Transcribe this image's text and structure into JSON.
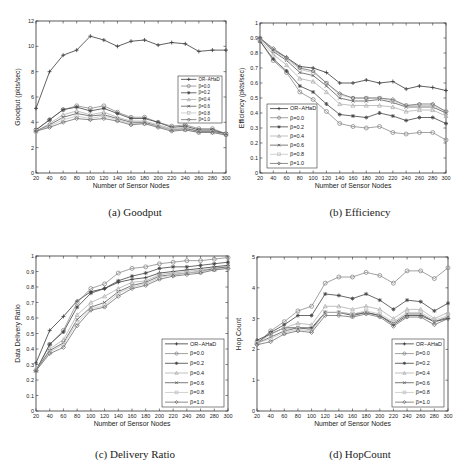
{
  "figure": {
    "captions": [
      "(a) Goodput",
      "(b) Efficiency",
      "(c) Delivery Ratio",
      "(d) HopCount"
    ]
  },
  "legend_labels": [
    "OR−AHaD",
    "β=0.0",
    "β=0.2",
    "β=0.4",
    "β=0.6",
    "β=0.8",
    "β=1.0"
  ],
  "chart_data": [
    {
      "type": "line",
      "title": "(a) Goodput",
      "xlabel": "Number of Sensor Nodes",
      "ylabel": "Goodput (pkts/sec)",
      "x": [
        20,
        40,
        60,
        80,
        100,
        120,
        140,
        160,
        180,
        200,
        220,
        240,
        260,
        280,
        300
      ],
      "xlim": [
        20,
        300
      ],
      "ylim": [
        0,
        12
      ],
      "yticks": [
        0,
        2,
        4,
        6,
        8,
        10,
        12
      ],
      "grid": false,
      "legend_position": "right-middle",
      "series": [
        {
          "name": "OR−AHaD",
          "marker": "plus",
          "values": [
            5.1,
            8.0,
            9.3,
            9.7,
            10.8,
            10.5,
            10.0,
            10.4,
            10.5,
            10.1,
            10.3,
            10.2,
            9.6,
            9.7,
            9.7
          ]
        },
        {
          "name": "β=0.0",
          "marker": "circle",
          "values": [
            3.4,
            4.2,
            5.0,
            5.3,
            5.1,
            5.3,
            4.8,
            4.4,
            4.4,
            4.0,
            3.7,
            3.8,
            3.5,
            3.5,
            3.1
          ]
        },
        {
          "name": "β=0.2",
          "marker": "star",
          "values": [
            3.4,
            4.2,
            5.0,
            5.2,
            4.9,
            5.1,
            4.7,
            4.3,
            4.3,
            4.0,
            3.6,
            3.7,
            3.4,
            3.4,
            3.1
          ]
        },
        {
          "name": "β=0.4",
          "marker": "triangle",
          "values": [
            3.3,
            3.9,
            4.6,
            4.9,
            4.6,
            4.8,
            4.4,
            4.1,
            4.1,
            3.8,
            3.5,
            3.6,
            3.3,
            3.3,
            3.1
          ]
        },
        {
          "name": "β=0.6",
          "marker": "x",
          "values": [
            3.3,
            3.8,
            4.4,
            4.7,
            4.5,
            4.6,
            4.3,
            4.0,
            4.0,
            3.7,
            3.4,
            3.5,
            3.3,
            3.3,
            3.1
          ]
        },
        {
          "name": "β=0.8",
          "marker": "square",
          "values": [
            3.3,
            3.7,
            4.2,
            4.5,
            4.3,
            4.5,
            4.2,
            3.9,
            3.9,
            3.7,
            3.4,
            3.4,
            3.2,
            3.2,
            3.0
          ]
        },
        {
          "name": "β=1.0",
          "marker": "diamond",
          "values": [
            3.3,
            3.6,
            4.0,
            4.3,
            4.2,
            4.3,
            4.1,
            3.8,
            3.9,
            3.6,
            3.3,
            3.4,
            3.2,
            3.2,
            3.0
          ]
        }
      ]
    },
    {
      "type": "line",
      "title": "(b) Efficiency",
      "xlabel": "Number of Sensor Nodes",
      "ylabel": "Efficiency (pkts/sec)",
      "x": [
        20,
        40,
        60,
        80,
        100,
        120,
        140,
        160,
        180,
        200,
        220,
        240,
        260,
        280,
        300
      ],
      "xlim": [
        20,
        300
      ],
      "ylim": [
        0,
        1
      ],
      "yticks": [
        0,
        0.1,
        0.2,
        0.3,
        0.4,
        0.5,
        0.6,
        0.7,
        0.8,
        0.9,
        1
      ],
      "grid": false,
      "legend_position": "lower-left",
      "series": [
        {
          "name": "OR−AHaD",
          "marker": "plus",
          "values": [
            0.9,
            0.82,
            0.77,
            0.71,
            0.7,
            0.67,
            0.6,
            0.6,
            0.62,
            0.6,
            0.61,
            0.56,
            0.58,
            0.57,
            0.55
          ]
        },
        {
          "name": "β=0.0",
          "marker": "circle",
          "values": [
            0.88,
            0.75,
            0.67,
            0.54,
            0.49,
            0.41,
            0.33,
            0.31,
            0.3,
            0.31,
            0.27,
            0.26,
            0.27,
            0.27,
            0.22
          ]
        },
        {
          "name": "β=0.2",
          "marker": "star",
          "values": [
            0.88,
            0.76,
            0.68,
            0.58,
            0.54,
            0.46,
            0.39,
            0.38,
            0.37,
            0.4,
            0.38,
            0.35,
            0.37,
            0.37,
            0.33
          ]
        },
        {
          "name": "β=0.4",
          "marker": "triangle",
          "values": [
            0.89,
            0.79,
            0.72,
            0.63,
            0.61,
            0.54,
            0.46,
            0.45,
            0.45,
            0.45,
            0.44,
            0.41,
            0.42,
            0.42,
            0.38
          ]
        },
        {
          "name": "β=0.6",
          "marker": "x",
          "values": [
            0.9,
            0.81,
            0.75,
            0.67,
            0.65,
            0.58,
            0.5,
            0.48,
            0.48,
            0.49,
            0.47,
            0.44,
            0.44,
            0.44,
            0.4
          ]
        },
        {
          "name": "β=0.8",
          "marker": "square",
          "values": [
            0.9,
            0.82,
            0.76,
            0.69,
            0.67,
            0.6,
            0.52,
            0.5,
            0.5,
            0.5,
            0.48,
            0.45,
            0.45,
            0.45,
            0.41
          ]
        },
        {
          "name": "β=1.0",
          "marker": "diamond",
          "values": [
            0.9,
            0.83,
            0.77,
            0.7,
            0.68,
            0.6,
            0.53,
            0.5,
            0.5,
            0.5,
            0.49,
            0.45,
            0.46,
            0.46,
            0.41
          ]
        }
      ]
    },
    {
      "type": "line",
      "title": "(c) Delivery Ratio",
      "xlabel": "Number of Sensor Nodes",
      "ylabel": "Data Delivery Ratio",
      "x": [
        20,
        40,
        60,
        80,
        100,
        120,
        140,
        160,
        180,
        200,
        220,
        240,
        260,
        280,
        300
      ],
      "xlim": [
        20,
        300
      ],
      "ylim": [
        0,
        1
      ],
      "yticks": [
        0,
        0.1,
        0.2,
        0.3,
        0.4,
        0.5,
        0.6,
        0.7,
        0.8,
        0.9,
        1
      ],
      "grid": false,
      "legend_position": "lower-right",
      "series": [
        {
          "name": "OR−AHaD",
          "marker": "plus",
          "values": [
            0.31,
            0.52,
            0.61,
            0.71,
            0.77,
            0.79,
            0.83,
            0.85,
            0.86,
            0.89,
            0.9,
            0.91,
            0.92,
            0.93,
            0.94
          ]
        },
        {
          "name": "β=0.0",
          "marker": "circle",
          "values": [
            0.26,
            0.43,
            0.52,
            0.7,
            0.79,
            0.82,
            0.89,
            0.92,
            0.93,
            0.95,
            0.96,
            0.97,
            0.97,
            0.98,
            0.99
          ]
        },
        {
          "name": "β=0.2",
          "marker": "star",
          "values": [
            0.26,
            0.43,
            0.51,
            0.67,
            0.76,
            0.79,
            0.84,
            0.87,
            0.89,
            0.92,
            0.93,
            0.93,
            0.94,
            0.95,
            0.96
          ]
        },
        {
          "name": "β=0.4",
          "marker": "triangle",
          "values": [
            0.26,
            0.4,
            0.46,
            0.62,
            0.7,
            0.74,
            0.79,
            0.83,
            0.84,
            0.88,
            0.89,
            0.9,
            0.91,
            0.92,
            0.93
          ]
        },
        {
          "name": "β=0.6",
          "marker": "x",
          "values": [
            0.26,
            0.39,
            0.44,
            0.59,
            0.67,
            0.7,
            0.77,
            0.81,
            0.83,
            0.87,
            0.88,
            0.89,
            0.9,
            0.92,
            0.93
          ]
        },
        {
          "name": "β=0.8",
          "marker": "square",
          "values": [
            0.26,
            0.38,
            0.43,
            0.57,
            0.66,
            0.68,
            0.76,
            0.8,
            0.82,
            0.86,
            0.88,
            0.89,
            0.9,
            0.91,
            0.92
          ]
        },
        {
          "name": "β=1.0",
          "marker": "diamond",
          "values": [
            0.26,
            0.37,
            0.41,
            0.55,
            0.65,
            0.67,
            0.74,
            0.79,
            0.81,
            0.85,
            0.87,
            0.88,
            0.89,
            0.91,
            0.92
          ]
        }
      ]
    },
    {
      "type": "line",
      "title": "(d) HopCount",
      "xlabel": "Number of Sensor Nodes",
      "ylabel": "Hop Count",
      "x": [
        20,
        40,
        60,
        80,
        100,
        120,
        140,
        160,
        180,
        200,
        220,
        240,
        260,
        280,
        300
      ],
      "xlim": [
        20,
        300
      ],
      "ylim": [
        0,
        5
      ],
      "yticks": [
        0,
        1,
        2,
        3,
        4,
        5
      ],
      "grid": false,
      "legend_position": "lower-right",
      "series": [
        {
          "name": "OR−AHaD",
          "marker": "plus",
          "values": [
            2.3,
            2.5,
            2.7,
            2.7,
            2.7,
            3.2,
            3.2,
            3.1,
            3.2,
            3.1,
            2.8,
            3.1,
            3.1,
            2.9,
            3.0
          ]
        },
        {
          "name": "β=0.0",
          "marker": "circle",
          "values": [
            2.2,
            2.6,
            2.9,
            3.25,
            3.4,
            4.15,
            4.35,
            4.35,
            4.5,
            4.4,
            4.15,
            4.55,
            4.55,
            4.3,
            4.65
          ]
        },
        {
          "name": "β=0.2",
          "marker": "star",
          "values": [
            2.2,
            2.55,
            2.8,
            3.1,
            3.1,
            3.8,
            3.75,
            3.65,
            3.8,
            3.6,
            3.3,
            3.6,
            3.55,
            3.25,
            3.5
          ]
        },
        {
          "name": "β=0.4",
          "marker": "triangle",
          "values": [
            2.2,
            2.5,
            2.7,
            2.85,
            2.8,
            3.4,
            3.4,
            3.3,
            3.4,
            3.3,
            3.0,
            3.3,
            3.3,
            3.0,
            3.2
          ]
        },
        {
          "name": "β=0.6",
          "marker": "x",
          "values": [
            2.2,
            2.4,
            2.6,
            2.7,
            2.65,
            3.2,
            3.2,
            3.15,
            3.2,
            3.1,
            2.85,
            3.15,
            3.15,
            2.9,
            3.05
          ]
        },
        {
          "name": "β=0.8",
          "marker": "square",
          "values": [
            2.2,
            2.35,
            2.55,
            2.65,
            2.6,
            3.2,
            3.2,
            3.15,
            3.25,
            3.15,
            2.9,
            3.2,
            3.2,
            2.95,
            3.1
          ]
        },
        {
          "name": "β=1.0",
          "marker": "diamond",
          "values": [
            2.15,
            2.25,
            2.5,
            2.6,
            2.55,
            3.1,
            3.1,
            3.05,
            3.15,
            3.05,
            2.75,
            3.05,
            3.05,
            2.8,
            3.0
          ]
        }
      ]
    }
  ],
  "series_colors": [
    "#3a3a3a",
    "#8a8a8a",
    "#444444",
    "#b0b0b0",
    "#5a5a5a",
    "#c4c4c4",
    "#6e6e6e"
  ]
}
